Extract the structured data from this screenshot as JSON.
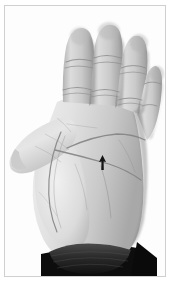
{
  "figure": {
    "title": "Open right palm, palmar view",
    "view": "palmar (palm facing camera)",
    "orientation": "fingers pointing up, thumb to the left",
    "color_mode": "grayscale",
    "frame": {
      "border_color": "#cfcfcf",
      "border_width_px": 1,
      "background_color": "#ffffff"
    }
  },
  "annotation": {
    "marker_name": "palm-arrow-marker",
    "marker_shape": "arrowhead pointing up",
    "marker_color": "#141414",
    "position_px": {
      "x": 99,
      "y": 156
    },
    "label": ""
  },
  "anatomy": {
    "fingers": [
      {
        "name": "index-finger",
        "label": "index"
      },
      {
        "name": "middle-finger",
        "label": "middle"
      },
      {
        "name": "ring-finger",
        "label": "ring"
      },
      {
        "name": "little-finger",
        "label": "little"
      }
    ],
    "thumb": {
      "name": "thumb",
      "label": "thumb"
    },
    "palm_creases": [
      {
        "name": "distal-transverse-crease",
        "label": "heart line"
      },
      {
        "name": "proximal-transverse-crease",
        "label": "head line"
      },
      {
        "name": "thenar-crease",
        "label": "life line"
      }
    ],
    "wrist": {
      "name": "wrist-band",
      "label": "dark sleeve cuff"
    }
  },
  "palette": {
    "skin_light": "#e9e9e9",
    "skin_mid": "#c8c8c8",
    "skin_shadow": "#9a9a9a",
    "skin_deep_shadow": "#6f6f6f",
    "crease_line": "#8a8a8a",
    "sleeve_dark": "#0d0d0d",
    "cuff_grey": "#3c3c3c",
    "background": "#ffffff",
    "marker": "#141414"
  }
}
